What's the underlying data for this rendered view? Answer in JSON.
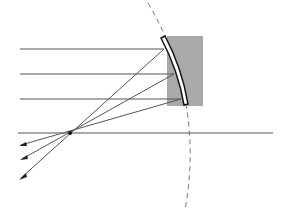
{
  "diagram": {
    "colors": {
      "ray": "#555555",
      "mirror_backing": "#a9a9a9",
      "mirror_edge": "#111111",
      "arc": "#777777"
    },
    "elements": [
      "incident-rays",
      "reflected-rays",
      "principal-axis",
      "focal-point",
      "concave-mirror",
      "curvature-arc"
    ]
  }
}
